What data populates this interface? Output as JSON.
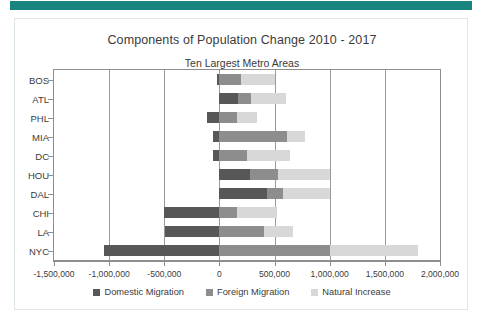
{
  "header": {
    "bar_color": "#19857e"
  },
  "card": {
    "border_color": "#dfe6e6",
    "background": "#ffffff"
  },
  "chart_data": {
    "type": "bar",
    "orientation": "horizontal",
    "stacked": true,
    "title": "Components of Population Change 2010 - 2017",
    "subtitle": "Ten Largest Metro Areas",
    "xlabel": "",
    "ylabel": "",
    "xlim": [
      -1500000,
      2000000
    ],
    "xticks": [
      -1500000,
      -1000000,
      -500000,
      0,
      500000,
      1000000,
      1500000,
      2000000
    ],
    "xticklabels": [
      "-1,500,000",
      "-1,000,000",
      "-500,000",
      "0",
      "500,000",
      "1,000,000",
      "1,500,000",
      "2,000,000"
    ],
    "grid": true,
    "legend_position": "bottom",
    "categories": [
      "BOS",
      "ATL",
      "PHL",
      "MIA",
      "DC",
      "HOU",
      "DAL",
      "CHI",
      "LA",
      "NYC"
    ],
    "series": [
      {
        "name": "Domestic Migration",
        "color": "#575757",
        "values": [
          -20000,
          170000,
          -110000,
          -60000,
          -60000,
          280000,
          430000,
          -500000,
          -490000,
          -1050000
        ]
      },
      {
        "name": "Foreign Migration",
        "color": "#8d8d8d",
        "values": [
          200000,
          120000,
          160000,
          610000,
          250000,
          250000,
          150000,
          160000,
          400000,
          1000000
        ]
      },
      {
        "name": "Natural Increase",
        "color": "#d8d8d8",
        "values": [
          300000,
          310000,
          180000,
          170000,
          390000,
          470000,
          420000,
          360000,
          270000,
          800000
        ]
      }
    ]
  }
}
